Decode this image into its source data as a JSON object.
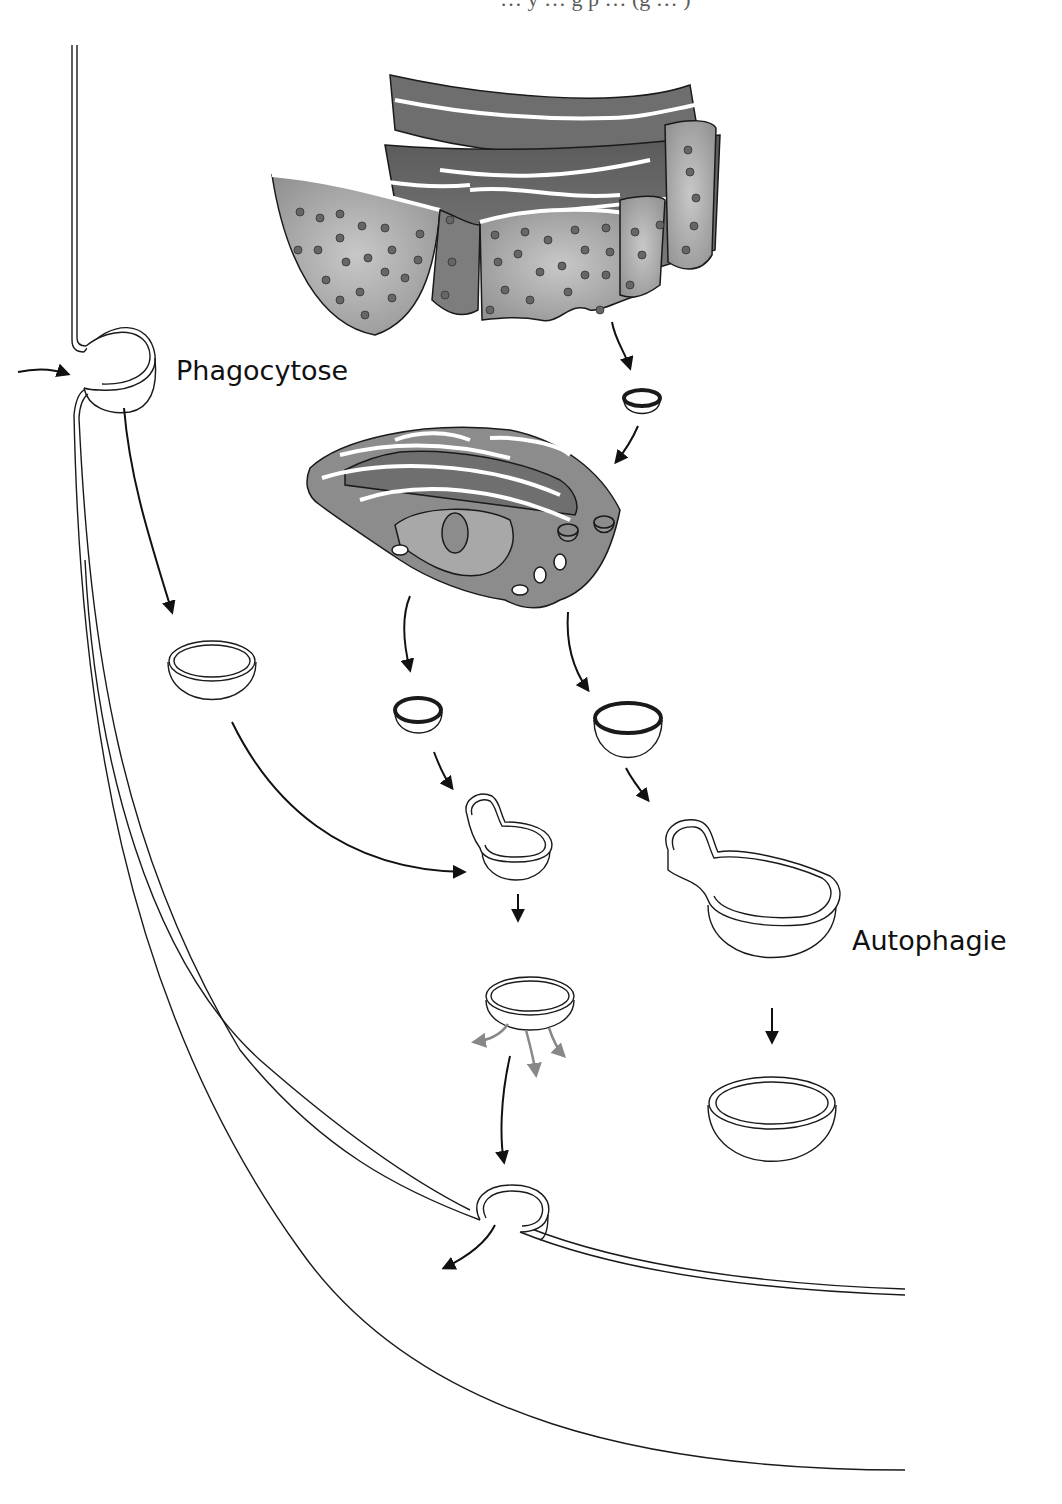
{
  "figure": {
    "labels": {
      "phagocytosis": "Phagocytose",
      "autophagy": "Autophagie"
    },
    "top_caption_fragment": "… y … g p … (g … )",
    "structures": [
      {
        "id": "plasma-membrane",
        "type": "double-line membrane"
      },
      {
        "id": "rough-er",
        "type": "organelle",
        "description": "rough endoplasmic reticulum with ribosomes"
      },
      {
        "id": "golgi",
        "type": "organelle",
        "description": "Golgi apparatus"
      },
      {
        "id": "transport-vesicle",
        "type": "vesicle"
      },
      {
        "id": "phagosome",
        "type": "vesicle"
      },
      {
        "id": "primary-lysosome-small",
        "type": "vesicle"
      },
      {
        "id": "primary-lysosome-large",
        "type": "vesicle"
      },
      {
        "id": "phagolysosome",
        "type": "vesicle"
      },
      {
        "id": "autophagolysosome",
        "type": "vesicle"
      },
      {
        "id": "residual-body",
        "type": "vesicle"
      },
      {
        "id": "digestion-vesicle",
        "type": "vesicle"
      },
      {
        "id": "exocytosis-vesicle",
        "type": "vesicle"
      }
    ],
    "colors": {
      "outline": "#1a1a1a",
      "er_fill": "#9a9a9a",
      "er_dark": "#4a4a4a",
      "golgi_fill": "#8c8c8c",
      "golgi_inner": "#a8a8a8",
      "ribosome": "#666666",
      "diffusion_arrow": "#888888"
    }
  }
}
